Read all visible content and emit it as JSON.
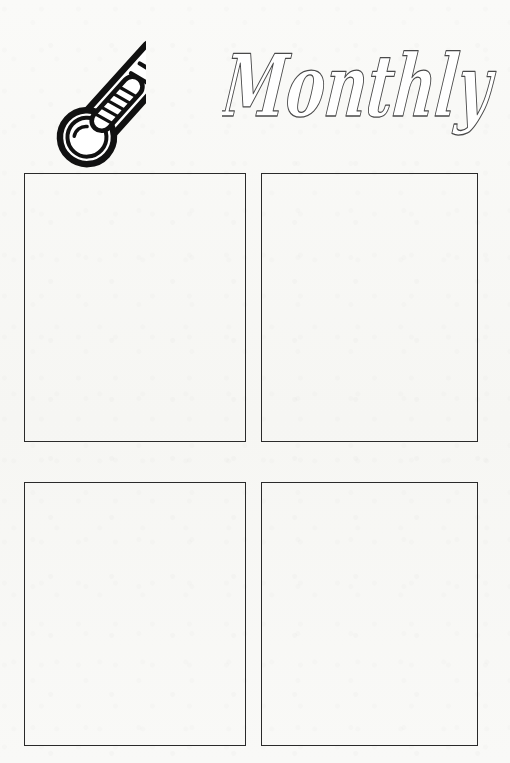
{
  "page": {
    "kind": "printable-worksheet",
    "orientation": "portrait",
    "background_color": "#f8f8f6",
    "ink_color": "#2a2a2a",
    "width_px": 510,
    "height_px": 763
  },
  "header": {
    "title": "Monthly",
    "title_style": "bold-outlined-script",
    "title_fill": "#ffffff",
    "title_stroke": "#3a3a3a",
    "decoration": {
      "icon_name": "thermometer-icon",
      "description": "outlined thermometer tilted up-left with bulb at lower right",
      "tick_marks": 2,
      "fill_segments": 5,
      "stroke_color": "#111111"
    }
  },
  "main": {
    "layout": "2x2-grid",
    "columns": 2,
    "rows": 2,
    "boxes": [
      {
        "id": "box-1",
        "label": "",
        "position": "top-left",
        "content": ""
      },
      {
        "id": "box-2",
        "label": "",
        "position": "top-right",
        "content": ""
      },
      {
        "id": "box-3",
        "label": "",
        "position": "bottom-left",
        "content": ""
      },
      {
        "id": "box-4",
        "label": "",
        "position": "bottom-right",
        "content": ""
      }
    ],
    "box_border_color": "#2a2a2a",
    "box_fill": "transparent"
  }
}
